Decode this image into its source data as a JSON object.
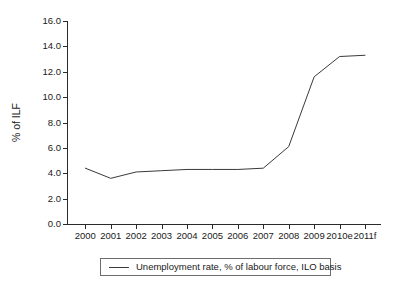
{
  "chart_data": {
    "type": "line",
    "title": "",
    "xlabel": "",
    "ylabel": "% of ILF",
    "categories": [
      "2000",
      "2001",
      "2002",
      "2003",
      "2004",
      "2005",
      "2006",
      "2007",
      "2008",
      "2009",
      "2010e",
      "2011f"
    ],
    "values": [
      4.4,
      3.6,
      4.1,
      4.2,
      4.3,
      4.3,
      4.3,
      4.4,
      6.1,
      11.6,
      13.2,
      13.3
    ],
    "series": [
      {
        "name": "Unemployment rate, % of labour force, ILO basis",
        "values": [
          4.4,
          3.6,
          4.1,
          4.2,
          4.3,
          4.3,
          4.3,
          4.4,
          6.1,
          11.6,
          13.2,
          13.3
        ],
        "color": "#3a3a3a"
      }
    ],
    "ylim": [
      0.0,
      16.0
    ],
    "ytick_step": 2.0,
    "ytick_labels": [
      "0.0",
      "2.0",
      "4.0",
      "6.0",
      "8.0",
      "10.0",
      "12.0",
      "14.0",
      "16.0"
    ],
    "ytick_values": [
      0,
      2,
      4,
      6,
      8,
      10,
      12,
      14,
      16
    ],
    "grid": false,
    "legend_position": "bottom-center",
    "legend_entries": [
      "Unemployment rate, % of labour force, ILO basis"
    ]
  },
  "legend": {
    "label": "Unemployment rate, % of labour force, ILO basis"
  },
  "axes": {
    "y_title": "% of ILF"
  },
  "colors": {
    "line": "#3a3a3a",
    "axis": "#2b2b2b",
    "text": "#1a1a1a",
    "legend_border": "#6d6d6d",
    "background": "#ffffff"
  }
}
